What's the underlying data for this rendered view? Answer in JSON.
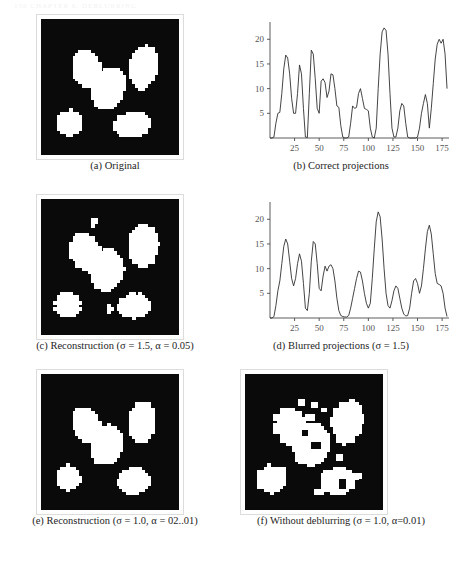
{
  "page": {
    "header_text": "150    CHAPTER 6.  DEBLURRING",
    "background": "#ffffff",
    "ink_color": "#1a1a1a"
  },
  "panels": [
    {
      "id": "a",
      "type": "image",
      "caption": "(a) Original",
      "caption_parts": {
        "label": "(a)",
        "title": "Original",
        "params": ""
      }
    },
    {
      "id": "b",
      "type": "chart",
      "caption": "(b) Correct projections",
      "caption_parts": {
        "label": "(b)",
        "title": "Correct projections",
        "params": ""
      }
    },
    {
      "id": "c",
      "type": "image",
      "caption": "(c) Reconstruction (σ = 1.5, α = 0.05)",
      "caption_parts": {
        "label": "(c)",
        "title": "Reconstruction",
        "params": "(σ = 1.5, α = 0.05)"
      }
    },
    {
      "id": "d",
      "type": "chart",
      "caption": "(d) Blurred projections (σ = 1.5)",
      "caption_parts": {
        "label": "(d)",
        "title": "Blurred projections",
        "params": "(σ = 1.5)"
      }
    },
    {
      "id": "e",
      "type": "image",
      "caption": "(e) Reconstruction (σ = 1.0, α = 02..01)",
      "caption_parts": {
        "label": "(e)",
        "title": "Reconstruction",
        "params": "(σ = 1.0, α = 02..01)"
      }
    },
    {
      "id": "f",
      "type": "image",
      "caption": "(f) Without deblurring (σ = 1.0, α=0.01)",
      "caption_parts": {
        "label": "(f)",
        "title": "Without deblurring",
        "params": "(σ = 1.0, α=0.01)"
      }
    }
  ],
  "chart_data": [
    {
      "type": "line",
      "panel": "b",
      "title": "Correct projections",
      "xlabel": "",
      "ylabel": "",
      "xlim": [
        0,
        182
      ],
      "ylim": [
        0,
        23.5
      ],
      "xticks": [
        25,
        50,
        75,
        100,
        125,
        150,
        175
      ],
      "yticks": [
        5,
        10,
        15,
        20
      ],
      "grid": false,
      "legend": "none",
      "line_color": "#303030",
      "x": [
        0,
        2,
        4,
        6,
        8,
        10,
        12,
        14,
        16,
        18,
        20,
        22,
        24,
        26,
        28,
        30,
        32,
        34,
        36,
        38,
        40,
        42,
        44,
        46,
        48,
        50,
        52,
        54,
        56,
        58,
        60,
        62,
        64,
        66,
        68,
        70,
        72,
        74,
        76,
        78,
        80,
        82,
        84,
        86,
        88,
        90,
        92,
        94,
        96,
        98,
        100,
        102,
        104,
        106,
        108,
        110,
        112,
        114,
        116,
        118,
        120,
        122,
        124,
        126,
        128,
        130,
        132,
        134,
        136,
        138,
        140,
        142,
        144,
        146,
        148,
        150,
        152,
        154,
        156,
        158,
        160,
        162,
        164,
        166,
        168,
        170,
        172,
        174,
        176,
        178,
        180
      ],
      "y": [
        0,
        0,
        0.2,
        3.0,
        5.0,
        5.2,
        9.0,
        14.0,
        16.8,
        16.2,
        13.0,
        8.0,
        5.0,
        5.0,
        9.0,
        14.8,
        13.0,
        6.0,
        0.2,
        0.1,
        9.0,
        17.8,
        17.0,
        12.0,
        6.0,
        5.0,
        11.5,
        12.0,
        11.2,
        8.2,
        9.5,
        13.0,
        12.8,
        10.0,
        6.5,
        6.2,
        2.5,
        0.2,
        0,
        0,
        0.2,
        3.0,
        6.5,
        6.0,
        6.2,
        9.0,
        10.0,
        8.0,
        6.0,
        5.8,
        5.5,
        2.0,
        0.2,
        0,
        2.0,
        10.0,
        17.0,
        21.5,
        22.3,
        21.8,
        17.0,
        9.0,
        2.0,
        0.2,
        0.2,
        2.0,
        5.5,
        7.0,
        6.5,
        3.0,
        0.2,
        0,
        0,
        0,
        0,
        0.2,
        2.0,
        5.0,
        7.0,
        8.8,
        7.0,
        2.0,
        6.0,
        11.0,
        16.0,
        19.0,
        20.0,
        19.2,
        20.0,
        17.0,
        10.0,
        7.0,
        6.8
      ]
    },
    {
      "type": "line",
      "panel": "d",
      "title": "Blurred projections",
      "xlabel": "",
      "ylabel": "",
      "xlim": [
        0,
        182
      ],
      "ylim": [
        0,
        23.5
      ],
      "xticks": [
        25,
        50,
        75,
        100,
        125,
        150,
        175
      ],
      "yticks": [
        5,
        10,
        15,
        20
      ],
      "grid": false,
      "legend": "none",
      "line_color": "#303030",
      "x": [
        0,
        2,
        4,
        6,
        8,
        10,
        12,
        14,
        16,
        18,
        20,
        22,
        24,
        26,
        28,
        30,
        32,
        34,
        36,
        38,
        40,
        42,
        44,
        46,
        48,
        50,
        52,
        54,
        56,
        58,
        60,
        62,
        64,
        66,
        68,
        70,
        72,
        74,
        76,
        78,
        80,
        82,
        84,
        86,
        88,
        90,
        92,
        94,
        96,
        98,
        100,
        102,
        104,
        106,
        108,
        110,
        112,
        114,
        116,
        118,
        120,
        122,
        124,
        126,
        128,
        130,
        132,
        134,
        136,
        138,
        140,
        142,
        144,
        146,
        148,
        150,
        152,
        154,
        156,
        158,
        160,
        162,
        164,
        166,
        168,
        170,
        172,
        174,
        176,
        178,
        180
      ],
      "y": [
        0,
        0,
        0.3,
        2.5,
        5.5,
        7.5,
        11.0,
        14.5,
        16.0,
        15.0,
        11.5,
        8.0,
        6.5,
        8.0,
        11.0,
        13.0,
        11.5,
        7.0,
        2.0,
        1.5,
        5.0,
        11.5,
        15.5,
        15.0,
        11.0,
        6.0,
        5.5,
        8.5,
        10.5,
        9.5,
        10.5,
        10.8,
        10.0,
        7.5,
        4.0,
        1.5,
        0.5,
        0.3,
        0.2,
        0.2,
        0.5,
        2.0,
        4.0,
        6.0,
        8.0,
        9.5,
        9.3,
        7.5,
        5.0,
        3.0,
        2.0,
        3.0,
        8.0,
        14.0,
        19.5,
        21.5,
        20.5,
        16.0,
        10.0,
        5.0,
        2.5,
        2.0,
        3.5,
        5.5,
        6.5,
        6.0,
        4.0,
        2.0,
        0.8,
        0.4,
        0.5,
        2.0,
        5.0,
        7.5,
        8.0,
        7.0,
        5.0,
        6.5,
        10.0,
        14.0,
        17.5,
        18.8,
        17.0,
        13.0,
        9.0,
        7.0,
        6.8,
        6.5,
        5.0,
        2.0,
        0.3
      ]
    }
  ],
  "images": {
    "grid_size": 44,
    "background_color": "#0a0a0a",
    "blob_color": "#ffffff",
    "panel_a_blobs": [
      {
        "cx": 14.5,
        "cy": 16.0,
        "rx": 4.6,
        "ry": 6.2,
        "rot": -20
      },
      {
        "cx": 21.5,
        "cy": 22.5,
        "rx": 5.2,
        "ry": 7.0,
        "rot": 18
      },
      {
        "cx": 32.5,
        "cy": 15.5,
        "rx": 4.4,
        "ry": 7.2,
        "rot": 8
      },
      {
        "cx": 9.0,
        "cy": 33.5,
        "rx": 4.3,
        "ry": 4.0,
        "rot": 0
      },
      {
        "cx": 29.0,
        "cy": 34.0,
        "rx": 6.0,
        "ry": 4.0,
        "rot": -6
      }
    ],
    "panel_c_blobs": [
      {
        "cx": 14.0,
        "cy": 17.0,
        "rx": 4.8,
        "ry": 6.0,
        "rot": -18
      },
      {
        "cx": 21.0,
        "cy": 23.0,
        "rx": 5.4,
        "ry": 6.8,
        "rot": 16
      },
      {
        "cx": 32.5,
        "cy": 15.0,
        "rx": 4.8,
        "ry": 7.0,
        "rot": 6
      },
      {
        "cx": 8.5,
        "cy": 34.0,
        "rx": 4.2,
        "ry": 4.2,
        "rot": 0
      },
      {
        "cx": 29.5,
        "cy": 34.5,
        "rx": 5.4,
        "ry": 4.0,
        "rot": -6
      },
      {
        "cx": 17.0,
        "cy": 7.5,
        "rx": 1.2,
        "ry": 1.2,
        "rot": 0
      },
      {
        "cx": 21.5,
        "cy": 35.5,
        "rx": 1.0,
        "ry": 1.4,
        "rot": 0
      }
    ],
    "panel_e_blobs": [
      {
        "cx": 14.5,
        "cy": 16.5,
        "rx": 4.4,
        "ry": 6.0,
        "rot": -20
      },
      {
        "cx": 21.0,
        "cy": 23.0,
        "rx": 5.0,
        "ry": 6.6,
        "rot": 16
      },
      {
        "cx": 32.0,
        "cy": 15.5,
        "rx": 4.2,
        "ry": 7.0,
        "rot": 6
      },
      {
        "cx": 8.5,
        "cy": 33.5,
        "rx": 4.0,
        "ry": 4.0,
        "rot": 0
      },
      {
        "cx": 29.5,
        "cy": 34.5,
        "rx": 5.4,
        "ry": 4.2,
        "rot": -6
      }
    ],
    "panel_f_blobs": [
      {
        "cx": 14.5,
        "cy": 17.0,
        "rx": 5.0,
        "ry": 6.4,
        "rot": -18
      },
      {
        "cx": 21.0,
        "cy": 23.0,
        "rx": 5.6,
        "ry": 7.0,
        "rot": 16
      },
      {
        "cx": 32.5,
        "cy": 15.5,
        "rx": 4.8,
        "ry": 7.4,
        "rot": 6
      },
      {
        "cx": 8.5,
        "cy": 34.0,
        "rx": 4.6,
        "ry": 4.4,
        "rot": 0
      },
      {
        "cx": 29.5,
        "cy": 34.5,
        "rx": 6.0,
        "ry": 4.4,
        "rot": -6
      }
    ],
    "panel_f_speckles": [
      {
        "x": 17,
        "y": 8,
        "w": 2,
        "h": 2
      },
      {
        "x": 21,
        "y": 9,
        "w": 2,
        "h": 2
      },
      {
        "x": 24,
        "y": 11,
        "w": 2,
        "h": 1
      },
      {
        "x": 27,
        "y": 14,
        "w": 2,
        "h": 2
      },
      {
        "x": 19,
        "y": 13,
        "w": 3,
        "h": 2
      },
      {
        "x": 12,
        "y": 20,
        "w": 2,
        "h": 2
      },
      {
        "x": 25,
        "y": 19,
        "w": 2,
        "h": 2
      },
      {
        "x": 29,
        "y": 26,
        "w": 2,
        "h": 2
      },
      {
        "x": 22,
        "y": 37,
        "w": 3,
        "h": 2
      },
      {
        "x": 35,
        "y": 32,
        "w": 2,
        "h": 2
      },
      {
        "x": 11,
        "y": 30,
        "w": 2,
        "h": 2
      },
      {
        "x": 31,
        "y": 9,
        "w": 2,
        "h": 2
      }
    ],
    "panel_f_holes": [
      {
        "x": 21,
        "y": 22,
        "w": 3,
        "h": 2
      },
      {
        "x": 30,
        "y": 34,
        "w": 2,
        "h": 3
      },
      {
        "x": 18,
        "y": 18,
        "w": 2,
        "h": 2
      }
    ]
  }
}
